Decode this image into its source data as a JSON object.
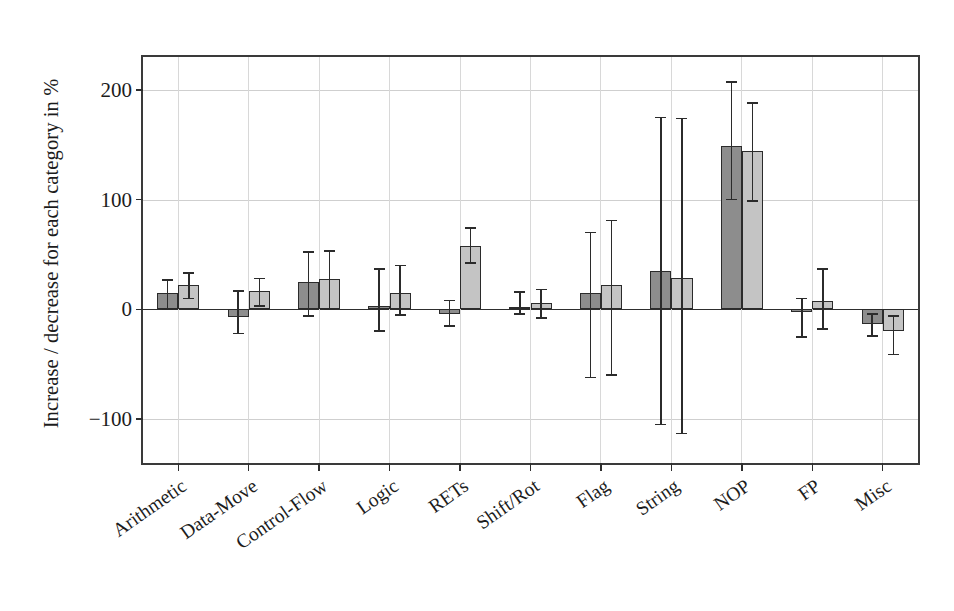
{
  "chart_data": {
    "type": "bar",
    "title": "",
    "xlabel": "",
    "ylabel": "Increase / decrease for each category in %",
    "ylim": [
      -140,
      230
    ],
    "yticks": [
      200,
      100,
      0,
      -100
    ],
    "ytick_labels": [
      "200",
      "100",
      "0",
      "−100"
    ],
    "grid": true,
    "legend": "none",
    "orientation": "vertical",
    "error_bars": true,
    "categories": [
      "Arithmetic",
      "Data-Move",
      "Control-Flow",
      "Logic",
      "RETs",
      "Shift/Rot",
      "Flag",
      "String",
      "NOP",
      "FP",
      "Misc"
    ],
    "series": [
      {
        "name": "series-dark",
        "color": "#8d8d8d",
        "values": [
          15,
          -7,
          25,
          3,
          -4,
          2,
          15,
          35,
          149,
          -2,
          -13
        ],
        "err_low": [
          0,
          -22,
          -6,
          -20,
          -15,
          -4,
          -62,
          -105,
          100,
          -25,
          -24
        ],
        "err_high": [
          27,
          17,
          52,
          37,
          8,
          16,
          70,
          175,
          207,
          10,
          -4
        ]
      },
      {
        "name": "series-light",
        "color": "#c4c4c4",
        "values": [
          22,
          17,
          28,
          15,
          58,
          6,
          22,
          29,
          144,
          8,
          -20
        ],
        "err_low": [
          10,
          3,
          0,
          -5,
          42,
          -8,
          -60,
          -113,
          99,
          -18,
          -41
        ],
        "err_high": [
          33,
          28,
          53,
          40,
          74,
          18,
          81,
          174,
          188,
          37,
          -6
        ]
      }
    ]
  }
}
